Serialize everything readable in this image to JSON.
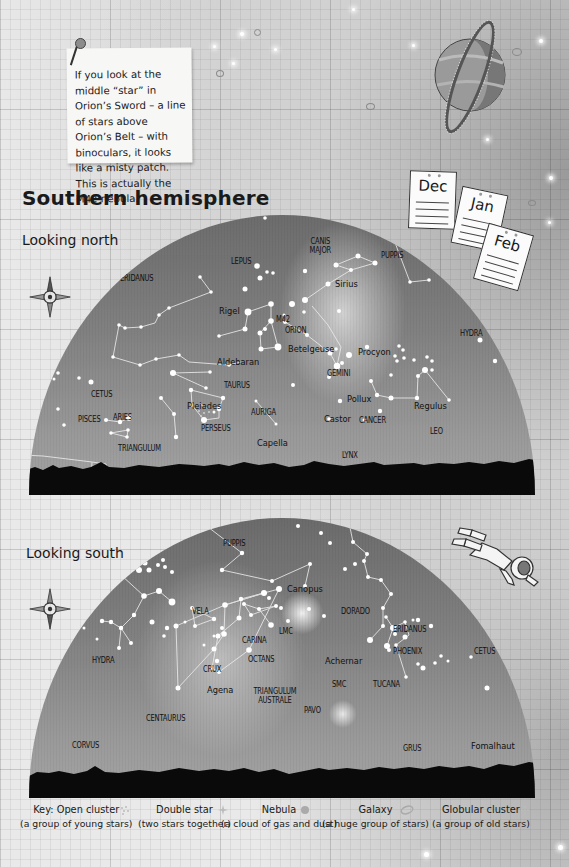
{
  "note": {
    "text": "If you look at the middle “star” in Orion’s Sword – a line of stars above Orion’s Belt – with binoculars, it looks like a misty patch. This is actually the M42 nebula."
  },
  "title": "Southern hemisphere",
  "calendar": [
    "Dec",
    "Jan",
    "Feb"
  ],
  "north": {
    "subtitle": "Looking north",
    "labels": {
      "eridanus": "ERIDANUS",
      "lepus": "LEPUS",
      "canis_major": "CANIS MAJOR",
      "puppis": "PUPPIS",
      "sirius": "Sirius",
      "rigel": "Rigel",
      "m42": "M42",
      "orion": "ORION",
      "betelgeuse": "Betelgeuse",
      "procyon": "Procyon",
      "hydra": "HYDRA",
      "aldebaran": "Aldebaran",
      "gemini": "GEMINI",
      "taurus": "TAURUS",
      "cetus": "CETUS",
      "pleiades": "Pleiades",
      "pollux": "Pollux",
      "regulus": "Regulus",
      "pisces": "PISCES",
      "aries": "ARIES",
      "auriga": "AURIGA",
      "perseus": "PERSEUS",
      "castor": "Castor",
      "cancer": "CANCER",
      "leo": "LEO",
      "capella": "Capella",
      "triangulum": "TRIANGULUM",
      "lynx": "LYNX"
    }
  },
  "south": {
    "subtitle": "Looking south",
    "labels": {
      "puppis": "PUPPIS",
      "canopus": "Canopus",
      "vela": "VELA",
      "lmc": "LMC",
      "dorado": "DORADO",
      "carina": "CARINA",
      "eridanus": "ERIDANUS",
      "hydra": "HYDRA",
      "achernar": "Achernar",
      "crux": "CRUX",
      "octans": "OCTANS",
      "phoenix": "PHOENIX",
      "cetus": "CETUS",
      "agena": "Agena",
      "smc": "SMC",
      "tucana": "TUCANA",
      "triangulum_australe": "TRIANGULUM AUSTRALE",
      "pavo": "PAVO",
      "centaurus": "CENTAURUS",
      "corvus": "CORVUS",
      "grus": "GRUS",
      "fomalhaut": "Fomalhaut"
    }
  },
  "key": {
    "prefix": "Key:",
    "items": [
      {
        "name": "Open cluster",
        "desc": "(a group of young stars)",
        "icon": "open-cluster-icon"
      },
      {
        "name": "Double star",
        "desc": "(two stars together)",
        "icon": "double-star-icon"
      },
      {
        "name": "Nebula",
        "desc": "(a cloud of gas and dust)",
        "icon": "nebula-icon"
      },
      {
        "name": "Galaxy",
        "desc": "(a huge group of stars)",
        "icon": "galaxy-icon"
      },
      {
        "name": "Globular cluster",
        "desc": "(a group of old stars)",
        "icon": "globular-cluster-icon"
      }
    ]
  }
}
